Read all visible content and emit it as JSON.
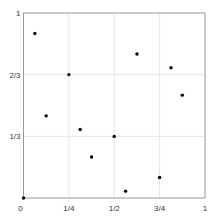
{
  "chart_data": {
    "type": "scatter",
    "title": "",
    "xlabel": "",
    "ylabel": "",
    "xlim": [
      0,
      1
    ],
    "ylim": [
      0,
      1
    ],
    "grid": true,
    "legend": null,
    "x_ticks": [
      {
        "value": 0,
        "label": "0"
      },
      {
        "value": 0.25,
        "label": "1/4"
      },
      {
        "value": 0.5,
        "label": "1/2"
      },
      {
        "value": 0.75,
        "label": "3/4"
      },
      {
        "value": 1,
        "label": "1"
      }
    ],
    "y_ticks": [
      {
        "value": 0.3333,
        "label": "1/3"
      },
      {
        "value": 0.6667,
        "label": "2/3"
      },
      {
        "value": 1,
        "label": "1"
      }
    ],
    "series": [
      {
        "name": "points",
        "color": "#000000",
        "x": [
          0,
          0.0625,
          0.125,
          0.25,
          0.3125,
          0.375,
          0.5,
          0.5625,
          0.625,
          0.75,
          0.8125,
          0.875
        ],
        "y": [
          0,
          0.889,
          0.444,
          0.667,
          0.37,
          0.222,
          0.333,
          0.037,
          0.778,
          0.111,
          0.704,
          0.556
        ]
      }
    ]
  },
  "style": {
    "axis_color": "#999999",
    "grid_color": "#e6e6e6",
    "point_color": "#000000"
  }
}
